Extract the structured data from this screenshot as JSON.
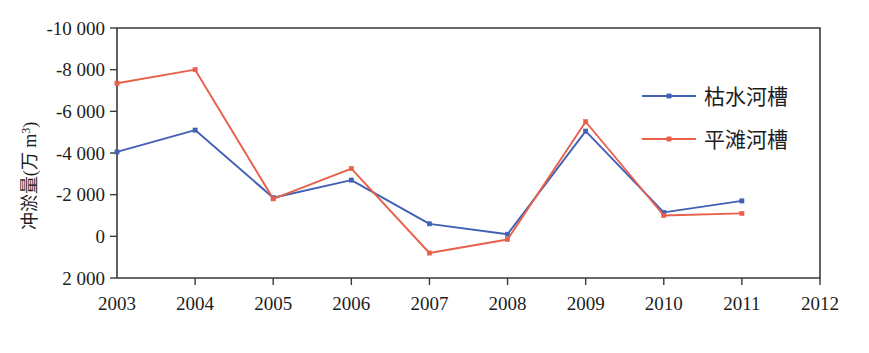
{
  "chart_data": {
    "type": "line",
    "title": "",
    "xlabel": "",
    "ylabel": "冲淤量(万 m³)",
    "ylabel_main": "冲淤量(万 m",
    "ylabel_sup": "3",
    "ylabel_tail": ")",
    "x": [
      2003,
      2004,
      2005,
      2006,
      2007,
      2008,
      2009,
      2010,
      2011
    ],
    "categories": [
      "2003",
      "2004",
      "2005",
      "2006",
      "2007",
      "2008",
      "2009",
      "2010",
      "2011"
    ],
    "xtick_labels": [
      "2003",
      "2004",
      "2005",
      "2006",
      "2007",
      "2008",
      "2009",
      "2010",
      "2011",
      "2012"
    ],
    "ytick_labels": [
      "-10 000",
      "-8 000",
      "-6 000",
      "-4 000",
      "-2 000",
      "0",
      "2 000"
    ],
    "ytick_values": [
      -10000,
      -8000,
      -6000,
      -4000,
      -2000,
      0,
      2000
    ],
    "xlim": [
      2003,
      2012
    ],
    "ylim": [
      -10000,
      2000
    ],
    "y_axis_inverted": true,
    "grid": false,
    "legend_position": "upper-right-inside",
    "series": [
      {
        "name": "枯水河槽",
        "color": "#4260B4",
        "marker": "square",
        "values": [
          -4050,
          -5100,
          -1850,
          -2700,
          -600,
          -100,
          -5050,
          -1150,
          -1700
        ]
      },
      {
        "name": "平滩河槽",
        "color": "#E8604A",
        "marker": "square",
        "values": [
          -7350,
          -8000,
          -1800,
          -3250,
          800,
          150,
          -5500,
          -1000,
          -1100
        ]
      }
    ]
  },
  "legend": {
    "items": [
      {
        "label": "枯水河槽",
        "color": "#4260B4"
      },
      {
        "label": "平滩河槽",
        "color": "#E8604A"
      }
    ]
  },
  "colors": {
    "series_blue": "#4260B4",
    "series_red": "#E8604A",
    "axis": "#3a3a3a",
    "text": "#1d1d1d",
    "background": "#ffffff"
  }
}
